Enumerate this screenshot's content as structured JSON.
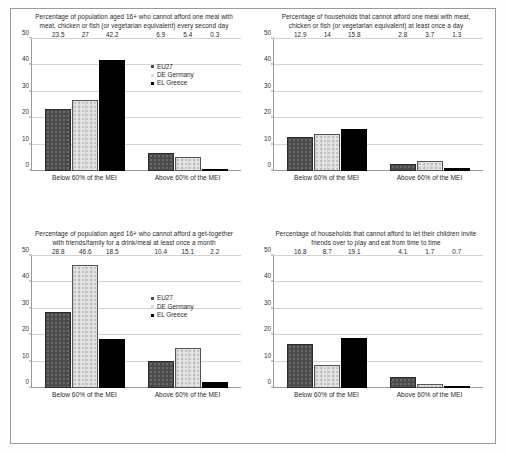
{
  "figure": {
    "axis": {
      "ticks": [
        0,
        10,
        20,
        30,
        40,
        50
      ],
      "ymin": 0,
      "ymax": 50
    },
    "categories": [
      "Below 60% of the MEI",
      "Above 60% of the MEI"
    ],
    "legend": {
      "eu27": "EU27",
      "de": "DE Germany",
      "el": "EL Greece"
    },
    "colors": {
      "eu27": "#4b4b4b",
      "de": "#e2e2e2",
      "el": "#000000",
      "frame": "#9a9a9a",
      "grid": "#d4d4d4",
      "text": "#2a2a2a"
    }
  },
  "chart_data": [
    {
      "id": "chart-top-left",
      "type": "bar",
      "title": "Percentage of population aged 16+ who cannot afford one meal with meat, chicken or fish (or vegetarian equivalent) every second day",
      "xlabel": "",
      "ylabel": "",
      "ylim": [
        0,
        50
      ],
      "yticks": [
        0,
        10,
        20,
        30,
        40,
        50
      ],
      "grid": true,
      "legend_position": "right-upper",
      "categories": [
        "Below 60% of the MEI",
        "Above 60% of the MEI"
      ],
      "series": [
        {
          "name": "EU27",
          "values": [
            23.5,
            6.9
          ]
        },
        {
          "name": "DE Germany",
          "values": [
            27,
            5.4
          ]
        },
        {
          "name": "EL Greece",
          "values": [
            42.2,
            0.3
          ]
        }
      ],
      "labels": [
        [
          "23.5",
          "6.9"
        ],
        [
          "27",
          "5.4"
        ],
        [
          "42.2",
          "0.3"
        ]
      ]
    },
    {
      "id": "chart-top-right",
      "type": "bar",
      "title": "Percentage of households that cannot afford one meal with meat, chicken or fish (or vegetarian equivalent) at least once a day",
      "xlabel": "",
      "ylabel": "",
      "ylim": [
        0,
        50
      ],
      "yticks": [
        0,
        10,
        20,
        30,
        40,
        50
      ],
      "grid": true,
      "legend_position": "none",
      "categories": [
        "Below 60% of the MEI",
        "Above 60% of the MEI"
      ],
      "series": [
        {
          "name": "EU27",
          "values": [
            12.9,
            2.8
          ]
        },
        {
          "name": "DE Germany",
          "values": [
            14,
            3.7
          ]
        },
        {
          "name": "EL Greece",
          "values": [
            15.8,
            1.3
          ]
        }
      ],
      "labels": [
        [
          "12.9",
          "2.8"
        ],
        [
          "14",
          "3.7"
        ],
        [
          "15.8",
          "1.3"
        ]
      ]
    },
    {
      "id": "chart-bottom-left",
      "type": "bar",
      "title": "Percentage of population aged 16+ who cannot afford a get-together with friends/family for a drink/meal at least once a month",
      "xlabel": "",
      "ylabel": "",
      "ylim": [
        0,
        50
      ],
      "yticks": [
        0,
        10,
        20,
        30,
        40,
        50
      ],
      "grid": true,
      "legend_position": "right-upper",
      "categories": [
        "Below 60% of the MEI",
        "Above 60% of the MEI"
      ],
      "series": [
        {
          "name": "EU27",
          "values": [
            28.8,
            10.4
          ]
        },
        {
          "name": "DE Germany",
          "values": [
            46.6,
            15.1
          ]
        },
        {
          "name": "EL Greece",
          "values": [
            18.5,
            2.2
          ]
        }
      ],
      "labels": [
        [
          "28.8",
          "10.4"
        ],
        [
          "46.6",
          "15.1"
        ],
        [
          "18.5",
          "2.2"
        ]
      ]
    },
    {
      "id": "chart-bottom-right",
      "type": "bar",
      "title": "Percentage of households that cannot afford to let their children invite friends over to play and eat from time to time",
      "xlabel": "",
      "ylabel": "",
      "ylim": [
        0,
        50
      ],
      "yticks": [
        0,
        10,
        20,
        30,
        40,
        50
      ],
      "grid": true,
      "legend_position": "none",
      "categories": [
        "Below 60% of the MEI",
        "Above 60% of the MEI"
      ],
      "series": [
        {
          "name": "EU27",
          "values": [
            16.8,
            4.1
          ]
        },
        {
          "name": "DE Germany",
          "values": [
            8.7,
            1.7
          ]
        },
        {
          "name": "EL Greece",
          "values": [
            19.1,
            0.7
          ]
        }
      ],
      "labels": [
        [
          "16.8",
          "4.1"
        ],
        [
          "8.7",
          "1.7"
        ],
        [
          "19.1",
          "0.7"
        ]
      ]
    }
  ]
}
